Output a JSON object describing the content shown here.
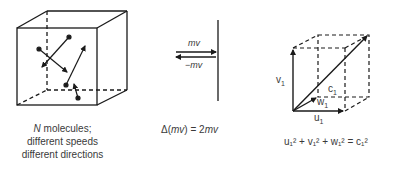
{
  "panel_left": {
    "caption_line1_italic": "N",
    "caption_line1_rest": " molecules;",
    "caption_line2": "different speeds",
    "caption_line3": "different directions"
  },
  "panel_middle": {
    "arrow_top_label": "mv",
    "arrow_bottom_label": "−mv",
    "equation_delta": "Δ(",
    "equation_mv": "mv",
    "equation_rest": ") = 2",
    "equation_mv2": "mv"
  },
  "panel_right": {
    "label_v": "v",
    "label_c": "c",
    "label_w": "w",
    "label_u": "u",
    "subscript": "1",
    "equation": "u₁² + v₁² + w₁² = c₁²"
  },
  "colors": {
    "stroke": "#1a1a1a",
    "text": "#3a3a3a"
  }
}
